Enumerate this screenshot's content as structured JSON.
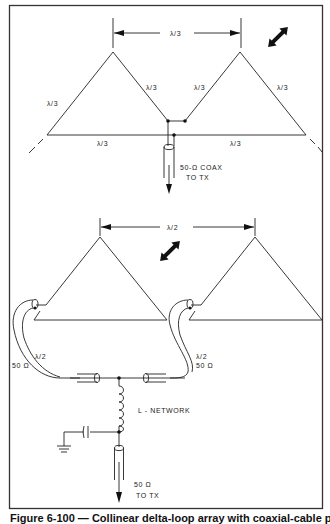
{
  "figure": {
    "caption": "Figure 6-100 — Collinear delta-loop array with coaxial-cable phasing",
    "top_diagram": {
      "title": "Collinear delta loops, direct feed",
      "spacing_label": "λ/3",
      "side_labels": [
        "λ/3",
        "λ/3",
        "λ/3",
        "λ/3"
      ],
      "base_labels": [
        "λ/3",
        "λ/3"
      ],
      "feed_label_line1": "50-Ω COAX",
      "feed_label_line2": "TO TX",
      "polarization_icon": "double-arrow-diagonal"
    },
    "bottom_diagram": {
      "title": "Delta loops fed with phasing lines and L-network",
      "spacing_label": "λ/2",
      "left_line_label_1": "λ/2",
      "left_line_label_2": "50 Ω",
      "right_line_label_1": "λ/2",
      "right_line_label_2": "50 Ω",
      "network_label": "L - NETWORK",
      "feed_label_line1": "50 Ω",
      "feed_label_line2": "TO TX",
      "polarization_icon": "double-arrow-diagonal"
    }
  }
}
